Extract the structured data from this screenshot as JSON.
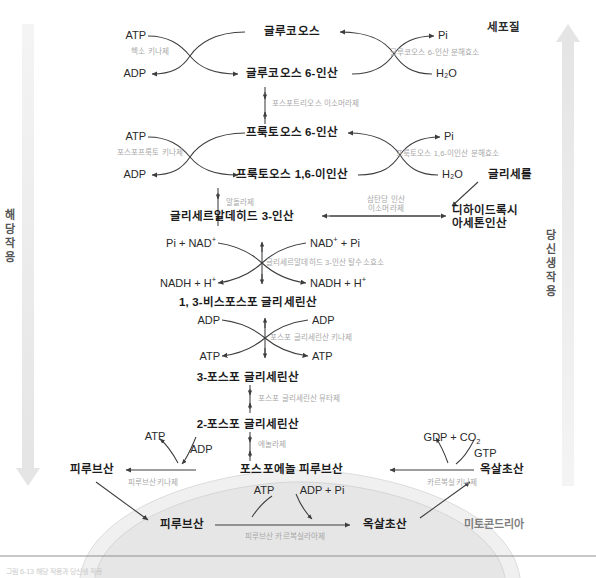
{
  "figure": {
    "caption": "그림 6-13  해당 작용과 당신생 작용",
    "compartments": {
      "cytosol": "세포질",
      "mitochondria": "미토콘드리아"
    },
    "side_labels": {
      "left": "해당작용",
      "right": "당신생작용"
    }
  },
  "metabolites": {
    "glucose": "글루코오스",
    "g6p": "글루코오스 6-인산",
    "f6p": "프룩토오스 6-인산",
    "fbp": "프룩토오스 1,6-이인산",
    "gap": "글리세르알데히드 3-인산",
    "dhap_line1": "디하이드록시",
    "dhap_line2": "아세톤인산",
    "bpg": "1, 3-비스포스포 글리세린산",
    "pg3": "3-포스포 글리세린산",
    "pg2": "2-포스포 글리세린산",
    "pep": "포스포에놀 피루브산",
    "pyruvate_cyt": "피루브산",
    "oaa_cyt": "옥살초산",
    "pyruvate_mito": "피루브산",
    "oaa_mito": "옥살초산",
    "glycerol": "글리세롤"
  },
  "cofactors": {
    "atp1": "ATP",
    "adp1": "ADP",
    "pi1": "Pi",
    "h2o1": "H₂O",
    "atp2": "ATP",
    "adp2": "ADP",
    "pi2": "Pi",
    "h2o2": "H₂O",
    "pi_nad": "Pi + NAD",
    "pi_nad_sup": "+",
    "nad_pi": "NAD",
    "nad_pi_sup": "+",
    "nad_pi_rest": " + Pi",
    "nadh_h_left": "NADH + H",
    "nadh_h_left_sup": "+",
    "nadh_h_right": "NADH + H",
    "nadh_h_right_sup": "+",
    "adp3": "ADP",
    "adp4": "ADP",
    "atp3": "ATP",
    "atp4": "ATP",
    "gdp_co2": "GDP + CO",
    "gdp_co2_sub": "2",
    "gtp": "GTP",
    "atp5": "ATP",
    "adp5": "ADP",
    "atp_mito": "ATP",
    "adp_pi_mito": "ADP + Pi"
  },
  "enzymes": {
    "hexokinase": "헥소 키나제",
    "g6pase": "글루코오스 6-인산 분해효소",
    "pgi": "포스포트리오스 이소머라제",
    "pfk": "포스포프룩토 키나제",
    "fbpase": "프룩토오스 1,6-이인산 분해효소",
    "aldolase": "알돌라제",
    "tpi_line1": "삼탄당 인산",
    "tpi_line2": "이소머라제",
    "gapdh": "글리세르알데히드 3-인산 탈수소효소",
    "pgk": "포스포 글리세린산 키나제",
    "pgm": "포스포 글리세린산 뮤타제",
    "enolase": "에놀라제",
    "pk": "피루브산키나제",
    "pepck": "카르복실키나제",
    "pc": "피루브산 카르복실라아제"
  },
  "colors": {
    "stroke": "#4a4a4a",
    "enzyme_text": "#a8a8a8",
    "metabolite_text": "#1b1b1b",
    "band": "#ececec",
    "membrane": "#e3e3e3"
  }
}
